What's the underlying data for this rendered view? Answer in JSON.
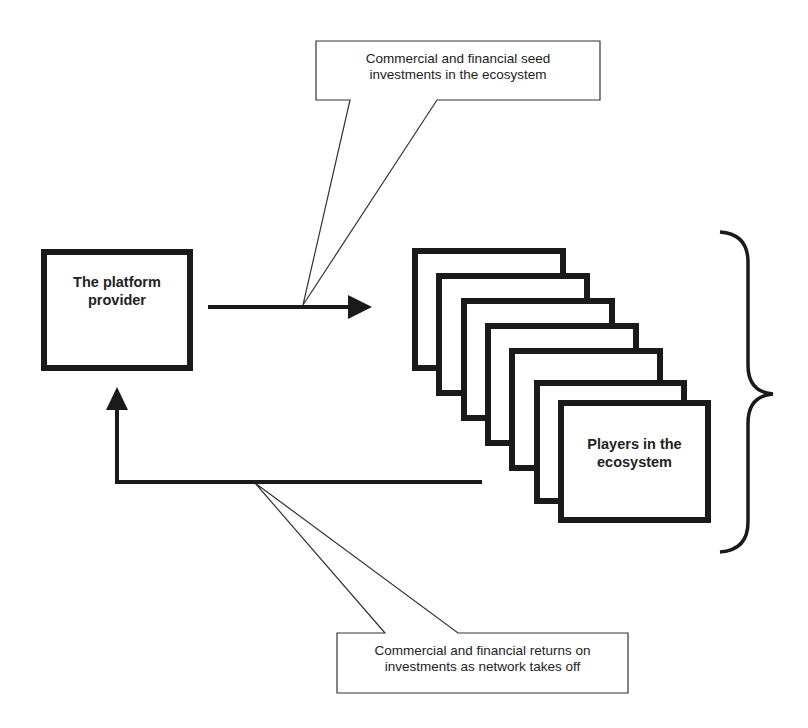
{
  "diagram": {
    "colors": {
      "stroke": "#1a1a1a",
      "background": "#ffffff"
    },
    "nodes": {
      "platform_provider": {
        "label_line1": "The platform",
        "label_line2": "provider"
      },
      "players": {
        "label_line1": "Players in the",
        "label_line2": "ecosystem",
        "stack_count": 7
      }
    },
    "callouts": {
      "top": {
        "line1": "Commercial and financial seed",
        "line2": "investments in the ecosystem"
      },
      "bottom": {
        "line1": "Commercial and financial returns on",
        "line2": "investments as network takes off"
      }
    },
    "edges": [
      {
        "from": "platform_provider",
        "to": "players",
        "label": "callouts.top"
      },
      {
        "from": "players",
        "to": "platform_provider",
        "label": "callouts.bottom"
      }
    ]
  }
}
